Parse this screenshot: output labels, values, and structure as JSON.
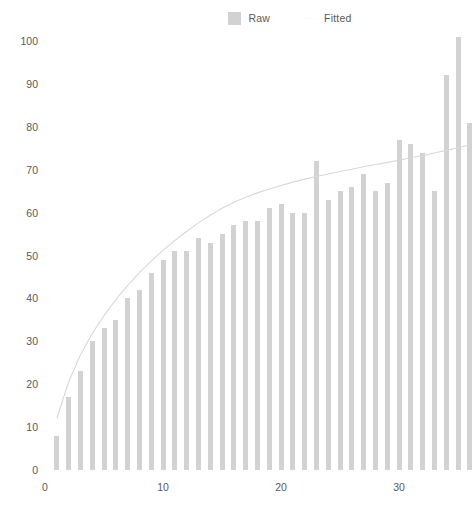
{
  "legend": {
    "position": "top-center",
    "items": [
      {
        "label": "Raw",
        "type": "box",
        "color": "#d2d2d2"
      },
      {
        "label": "Fitted",
        "type": "line",
        "color": "#fbfbfb"
      }
    ]
  },
  "axes": {
    "y_ticks": [
      "0",
      "10",
      "20",
      "30",
      "40",
      "50",
      "60",
      "70",
      "80",
      "90",
      "100"
    ],
    "x_ticks": [
      "0",
      "10",
      "20",
      "30"
    ]
  },
  "chart_data": {
    "type": "bar",
    "title": "",
    "subtitle": "",
    "xlabel": "",
    "ylabel": "",
    "xlim": [
      -0.6,
      36.2
    ],
    "ylim": [
      0,
      104
    ],
    "grid": false,
    "legend_position": "top-center",
    "bar_color": "#d2d2d2",
    "line_color": "#d8d8d8",
    "x": [
      1,
      2,
      3,
      4,
      5,
      6,
      7,
      8,
      9,
      10,
      11,
      12,
      13,
      14,
      15,
      16,
      17,
      18,
      19,
      20,
      21,
      22,
      23,
      24,
      25,
      26,
      27,
      28,
      29,
      30,
      31,
      32,
      33,
      34,
      35,
      36
    ],
    "series": [
      {
        "name": "Raw",
        "type": "bar",
        "values": [
          8,
          17,
          23,
          30,
          33,
          35,
          40,
          42,
          46,
          49,
          51,
          51,
          54,
          53,
          55,
          57,
          58,
          58,
          61,
          62,
          60,
          60,
          72,
          63,
          65,
          66,
          69,
          65,
          67,
          77,
          76,
          74,
          65,
          92,
          101,
          81
        ]
      },
      {
        "name": "Fitted",
        "type": "line",
        "values": [
          12.0,
          20.5,
          26.8,
          31.8,
          36.0,
          39.7,
          43.0,
          46.0,
          48.7,
          51.2,
          53.5,
          55.6,
          57.6,
          59.4,
          61.0,
          62.4,
          63.6,
          64.6,
          65.5,
          66.3,
          67.1,
          67.8,
          68.4,
          69.0,
          69.6,
          70.1,
          70.7,
          71.2,
          71.7,
          72.2,
          72.8,
          73.3,
          73.9,
          74.5,
          75.1,
          75.8
        ]
      }
    ]
  }
}
